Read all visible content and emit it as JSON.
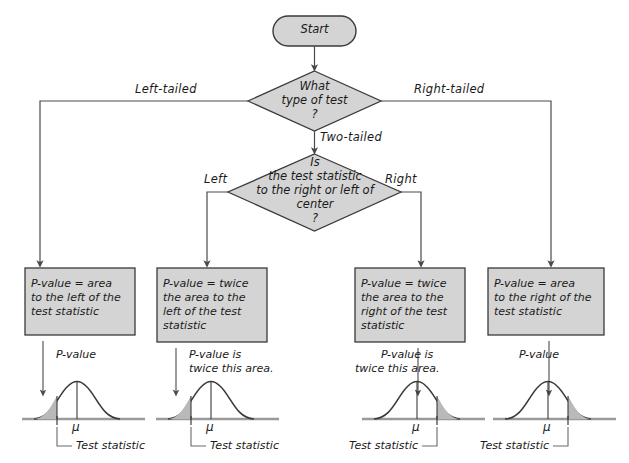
{
  "diagram": {
    "colors": {
      "node_fill": "#d4d4d4",
      "node_stroke": "#3a3a3a",
      "ink": "#1a1a1a",
      "connector": "#4a4a4a",
      "shade": "#b9b9b9",
      "baseline": "#9a9a9a"
    }
  },
  "start": {
    "label": "Start"
  },
  "decision1": {
    "lines": [
      "What",
      "type of test",
      "?"
    ],
    "branches": {
      "left": "Left-tailed",
      "right": "Right-tailed",
      "down": "Two-tailed"
    }
  },
  "decision2": {
    "lines": [
      "Is",
      "the test statistic",
      "to the right or left of",
      "center",
      "?"
    ],
    "branches": {
      "left": "Left",
      "right": "Right"
    }
  },
  "boxes": [
    {
      "id": "box-left-tailed",
      "lines": [
        "P-value = area",
        "to the left of the",
        "test statistic"
      ]
    },
    {
      "id": "box-two-tailed-left",
      "lines": [
        "P-value = twice",
        "the area to the",
        "left of the test",
        "statistic"
      ]
    },
    {
      "id": "box-two-tailed-right",
      "lines": [
        "P-value = twice",
        "the area to the",
        "right of the test",
        "statistic"
      ]
    },
    {
      "id": "box-right-tailed",
      "lines": [
        "P-value = area",
        "to the right of the",
        "test statistic"
      ]
    }
  ],
  "curves": [
    {
      "id": "curve-left-tail",
      "tail": "left",
      "annotation": [
        "P-value"
      ],
      "center_label": "μ",
      "statistic_label": "Test statistic"
    },
    {
      "id": "curve-two-tailed-left",
      "tail": "left",
      "annotation": [
        "P-value is",
        "twice this area."
      ],
      "center_label": "μ",
      "statistic_label": "Test statistic"
    },
    {
      "id": "curve-two-tailed-right",
      "tail": "right",
      "annotation": [
        "P-value is",
        "twice this area."
      ],
      "center_label": "μ",
      "statistic_label": "Test statistic"
    },
    {
      "id": "curve-right-tail",
      "tail": "right",
      "annotation": [
        "P-value"
      ],
      "center_label": "μ",
      "statistic_label": "Test statistic"
    }
  ]
}
